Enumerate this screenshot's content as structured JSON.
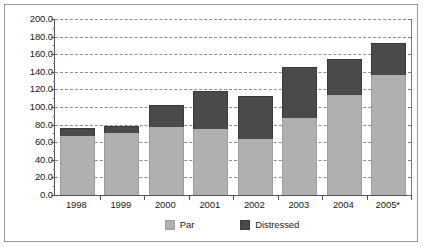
{
  "chart_data": {
    "type": "bar",
    "stacked": true,
    "title": "",
    "subtitle": "",
    "xlabel": "",
    "ylabel": "",
    "ylim": [
      0.0,
      200.0
    ],
    "ytick_step": 20.0,
    "ytick_labels": [
      "200.0",
      "180.0",
      "160.0",
      "140.0",
      "120.0",
      "100.0",
      "80.0",
      "60.0",
      "40.0",
      "20.0",
      "0.0"
    ],
    "ytick_values": [
      200.0,
      180.0,
      160.0,
      140.0,
      120.0,
      100.0,
      80.0,
      60.0,
      40.0,
      20.0,
      0.0
    ],
    "grid": true,
    "grid_style": "dashed-horizontal",
    "legend_position": "bottom",
    "categories": [
      "1998",
      "1999",
      "2000",
      "2001",
      "2002",
      "2003",
      "2004",
      "2005*"
    ],
    "series": [
      {
        "name": "Par",
        "color": "#b0b0b0",
        "values": [
          67,
          70,
          77,
          75,
          64,
          87,
          114,
          136
        ]
      },
      {
        "name": "Distressed",
        "color": "#4a4a4a",
        "values": [
          9,
          8,
          25,
          43,
          49,
          58,
          41,
          37
        ]
      }
    ],
    "totals": [
      76,
      78,
      102,
      118,
      113,
      145,
      155,
      173
    ],
    "annotations": [
      "* denotes estimate or partial year"
    ]
  },
  "legend": {
    "items": [
      {
        "label": "Par",
        "color": "#b0b0b0"
      },
      {
        "label": "Distressed",
        "color": "#4a4a4a"
      }
    ]
  },
  "colors": {
    "par": "#b0b0b0",
    "distressed": "#4a4a4a",
    "axis": "#555555",
    "gridline": "#8d8d8d",
    "frame_border": "#9a9a9a",
    "background": "#ffffff",
    "text": "#1a1a1a"
  }
}
